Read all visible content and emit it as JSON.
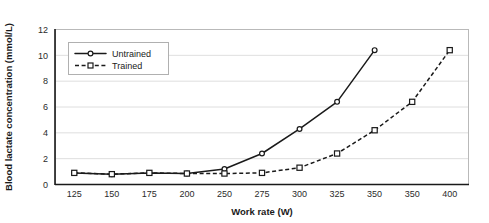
{
  "chart_data": {
    "type": "line",
    "title": "",
    "xlabel": "Work rate (W)",
    "ylabel": "Blood lactate concentration (mmol/L)",
    "x": [
      125,
      150,
      175,
      200,
      250,
      275,
      300,
      325,
      350,
      350,
      400
    ],
    "xtick_labels": [
      "125",
      "150",
      "175",
      "200",
      "250",
      "275",
      "300",
      "325",
      "350",
      "350",
      "400"
    ],
    "ytick_labels": [
      "0",
      "2",
      "4",
      "6",
      "8",
      "10",
      "12"
    ],
    "yticks": [
      0,
      2,
      4,
      6,
      8,
      10,
      12
    ],
    "ylim": [
      0,
      12
    ],
    "grid": "horizontal",
    "legend_position": "upper-left-inside",
    "series": [
      {
        "name": "Untrained",
        "marker": "open-circle",
        "linestyle": "solid",
        "color": "#1a1a1a",
        "x": [
          125,
          150,
          175,
          200,
          250,
          275,
          300,
          325,
          350
        ],
        "values": [
          0.9,
          0.8,
          0.9,
          0.85,
          1.2,
          2.4,
          4.3,
          6.4,
          10.4
        ]
      },
      {
        "name": "Trained",
        "marker": "open-square",
        "linestyle": "dashed",
        "color": "#1a1a1a",
        "x": [
          125,
          150,
          175,
          200,
          250,
          275,
          300,
          325,
          350,
          350,
          400
        ],
        "values": [
          0.9,
          0.8,
          0.9,
          0.85,
          0.85,
          0.9,
          1.3,
          2.4,
          4.2,
          6.4,
          10.4
        ]
      }
    ]
  },
  "legend": {
    "entries": [
      {
        "label": "Untrained"
      },
      {
        "label": "Trained"
      }
    ]
  },
  "colors": {
    "ink": "#1a1a1a",
    "grid": "#d6d6d6",
    "frame": "#b9b9b9",
    "background": "#ffffff"
  }
}
